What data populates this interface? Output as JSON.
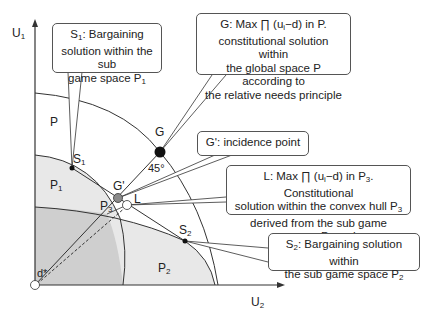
{
  "axes": {
    "y_label": "U",
    "y_label_sub": "1",
    "x_label": "U",
    "x_label_sub": "2",
    "origin_label": "d*"
  },
  "regions": {
    "p": "P",
    "p1": "P",
    "p1_sub": "1",
    "p2": "P",
    "p2_sub": "2",
    "p3": "P",
    "p3_sub": "3"
  },
  "points": {
    "g": "G",
    "g_prime": "G'",
    "l": "L",
    "s1": "S",
    "s1_sub": "1",
    "s2": "S",
    "s2_sub": "2",
    "angle": "45°"
  },
  "callouts": {
    "s1": {
      "line1_pre": "S",
      "line1_sub": "1",
      "line1_post": ": Bargaining",
      "line2": "solution within the sub",
      "line3_pre": "game space P",
      "line3_sub": "1"
    },
    "g": {
      "line1": "G: Max ∏ (u",
      "line1_sub": "i",
      "line1_post": "−d) in P.",
      "line2": "constitutional solution within",
      "line3": "the global space P according to",
      "line4": "the relative needs principle"
    },
    "g_prime": {
      "text": "G': incidence point"
    },
    "l": {
      "line1_pre": "L: Max ∏ (u",
      "line1_sub": "i",
      "line1_mid": "−d) in P",
      "line1_sub2": "3",
      "line1_post": ". Constitutional",
      "line2_pre": "solution within the convex hull P",
      "line2_sub": "3",
      "line3_pre": "derived from the sub game spaces P",
      "line3_sub": "1",
      "line3_post": " and"
    },
    "s2": {
      "line1_pre": "S",
      "line1_sub": "2",
      "line1_post": ": Bargaining solution within",
      "line2_pre": "the sub game space P",
      "line2_sub": "2"
    }
  },
  "colors": {
    "light_region": "#e6e6e6",
    "dark_region": "#cfcfcf",
    "line": "#333333",
    "g_prime_fill": "#8a8a8a"
  }
}
